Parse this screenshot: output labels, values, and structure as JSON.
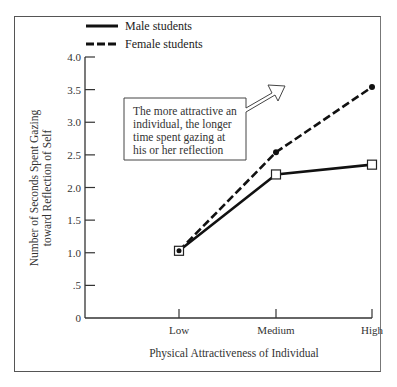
{
  "chart_data": {
    "type": "line",
    "title": "",
    "xlabel": "Physical Attractiveness of Individual",
    "ylabel_line1": "Number of Seconds Spent Gazing",
    "ylabel_line2": "toward Reflection of Self",
    "ylabel": "Number of Seconds Spent Gazing toward Reflection of Self",
    "categories": [
      "Low",
      "Medium",
      "High"
    ],
    "ylim": [
      0,
      4.0
    ],
    "yticks": [
      "0",
      ".5",
      "1.0",
      "1.5",
      "2.0",
      "2.5",
      "3.0",
      "3.5",
      "4.0"
    ],
    "grid": false,
    "legend_position": "top",
    "series": [
      {
        "name": "Male students",
        "style": "solid",
        "marker": "open-square",
        "values": [
          1.03,
          2.2,
          2.35
        ]
      },
      {
        "name": "Female students",
        "style": "dashed",
        "marker": "filled-circle",
        "values": [
          1.03,
          2.54,
          3.54
        ]
      }
    ],
    "annotations": [
      {
        "text_lines": [
          "The more attractive an",
          "individual, the longer",
          "time spent gazing at",
          "his or her reflection"
        ],
        "shape": "box-with-arrow-pointing-up-right"
      }
    ]
  },
  "legend": {
    "male_label": "Male students",
    "female_label": "Female students"
  },
  "colors": {
    "line": "#111111",
    "frame": "#555555",
    "text": "#333333"
  }
}
